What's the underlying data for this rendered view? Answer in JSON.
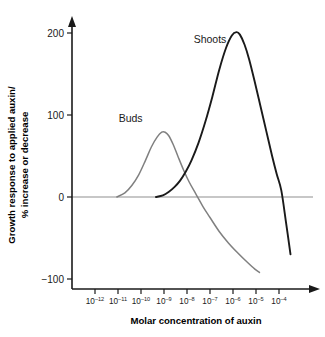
{
  "chart_data": {
    "type": "line",
    "title": "",
    "xlabel": "Molar concentration of auxin",
    "ylabel_line1": "Growth response to applied auxin/",
    "ylabel_line2": "% increase or decrease",
    "grid": false,
    "legend_position": "inline-annotation",
    "x_tick_labels": [
      "10-12",
      "10-11",
      "10-10",
      "10-9",
      "10-8",
      "10-7",
      "10-6",
      "10-5",
      "10-4"
    ],
    "x_tick_base": [
      "10",
      "10",
      "10",
      "10",
      "10",
      "10",
      "10",
      "10",
      "10"
    ],
    "x_tick_exponents": [
      "–12",
      "–11",
      "–10",
      "–9",
      "–8",
      "–7",
      "–6",
      "–5",
      "–4"
    ],
    "x_tick_log_values": [
      -12,
      -11,
      -10,
      -9,
      -8,
      -7,
      -6,
      -5,
      -4
    ],
    "xlim_log": [
      -12.7,
      -3.3
    ],
    "y_tick_labels": [
      "200",
      "100",
      "0",
      "−100"
    ],
    "y_tick_values": [
      200,
      100,
      0,
      -100
    ],
    "ylim": [
      -100,
      215
    ],
    "zero_line_value": 0,
    "series": [
      {
        "name": "Buds",
        "color": "#808080",
        "label": "Buds",
        "label_x_log": -10.45,
        "label_y": 92,
        "x_log": [
          -11.05,
          -10.7,
          -10.4,
          -10.1,
          -9.8,
          -9.55,
          -9.3,
          -9.1,
          -8.95,
          -8.8,
          -8.6,
          -8.4,
          -8.15,
          -7.9,
          -7.6,
          -7.3,
          -7.0,
          -6.6,
          -6.2,
          -5.8,
          -5.4,
          -5.05,
          -4.85
        ],
        "values": [
          0,
          5,
          14,
          27,
          45,
          61,
          73,
          79,
          79,
          75,
          64,
          50,
          33,
          18,
          3,
          -12,
          -25,
          -42,
          -56,
          -68,
          -79,
          -88,
          -92
        ]
      },
      {
        "name": "Shoots",
        "color": "#1a1a1a",
        "label": "Shoots",
        "label_x_log": -7.0,
        "label_y": 188,
        "x_log": [
          -9.35,
          -9.05,
          -8.8,
          -8.55,
          -8.3,
          -8.05,
          -7.8,
          -7.5,
          -7.2,
          -6.9,
          -6.6,
          -6.3,
          -6.05,
          -5.85,
          -5.7,
          -5.5,
          -5.3,
          -5.05,
          -4.8,
          -4.55,
          -4.3,
          -4.1,
          -3.9,
          -3.7,
          -3.5
        ],
        "values": [
          0,
          2,
          6,
          12,
          20,
          31,
          45,
          66,
          92,
          122,
          155,
          182,
          197,
          201,
          198,
          186,
          168,
          140,
          110,
          80,
          50,
          28,
          8,
          -30,
          -70
        ]
      }
    ],
    "annotations": [
      {
        "text": "Buds",
        "series": "Buds"
      },
      {
        "text": "Shoots",
        "series": "Shoots"
      }
    ]
  }
}
